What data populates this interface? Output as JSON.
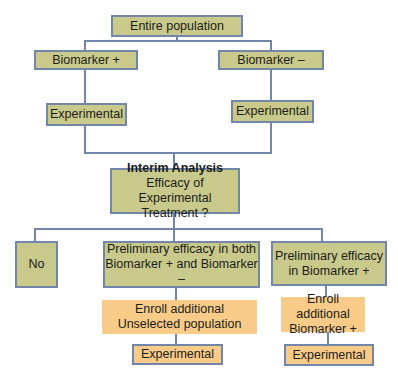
{
  "diagram": {
    "type": "flowchart",
    "colors": {
      "green_fill": "#c8c98a",
      "orange_fill": "#f8cb88",
      "border": "#7186a8",
      "connector": "#7186a8"
    },
    "nodes": {
      "entire_population": {
        "label": "Entire population"
      },
      "biomarker_pos": {
        "label": "Biomarker +"
      },
      "biomarker_neg": {
        "label": "Biomarker –"
      },
      "experimental_pos": {
        "label": "Experimental"
      },
      "experimental_neg": {
        "label": "Experimental"
      },
      "interim": {
        "title": "Interim Analysis",
        "line1": "Efficacy of Experimental",
        "line2": "Treatment ?"
      },
      "no": {
        "label": "No"
      },
      "prelim_both": {
        "line1": "Preliminary efficacy in both",
        "line2": "Biomarker + and Biomarker –"
      },
      "prelim_pos": {
        "line1": "Preliminary efficacy",
        "line2": "in Biomarker +"
      },
      "enroll_unselected": {
        "line1": "Enroll additional",
        "line2": "Unselected population"
      },
      "enroll_pos": {
        "line1": "Enroll additional",
        "line2": "Biomarker +"
      },
      "experimental_unselected": {
        "label": "Experimental"
      },
      "experimental_pos_final": {
        "label": "Experimental"
      }
    },
    "edges": [
      [
        "entire_population",
        "biomarker_pos"
      ],
      [
        "entire_population",
        "biomarker_neg"
      ],
      [
        "biomarker_pos",
        "experimental_pos"
      ],
      [
        "biomarker_neg",
        "experimental_neg"
      ],
      [
        "experimental_pos",
        "interim"
      ],
      [
        "experimental_neg",
        "interim"
      ],
      [
        "interim",
        "no"
      ],
      [
        "interim",
        "prelim_both"
      ],
      [
        "interim",
        "prelim_pos"
      ],
      [
        "prelim_both",
        "enroll_unselected"
      ],
      [
        "prelim_pos",
        "enroll_pos"
      ],
      [
        "enroll_unselected",
        "experimental_unselected"
      ],
      [
        "enroll_pos",
        "experimental_pos_final"
      ]
    ]
  }
}
